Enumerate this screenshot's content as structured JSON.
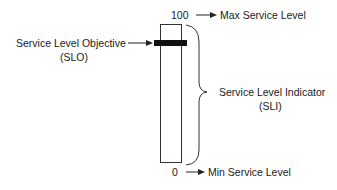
{
  "diagram": {
    "top_value": "100",
    "top_label": "Max Service Level",
    "bottom_value": "0",
    "bottom_label": "Min Service Level",
    "slo_label_line1": "Service Level Objective",
    "slo_label_line2": "(SLO)",
    "sli_label_line1": "Service Level Indicator",
    "sli_label_line2": "(SLI)"
  }
}
